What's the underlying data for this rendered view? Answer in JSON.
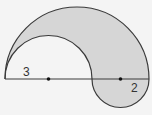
{
  "diagram": {
    "labels": {
      "left_radius": "3",
      "right_radius": "2"
    },
    "colors": {
      "background": "#f4f4f4",
      "shade": "#d6d6d6",
      "stroke": "#3a3a3a",
      "dot": "#111111"
    }
  }
}
